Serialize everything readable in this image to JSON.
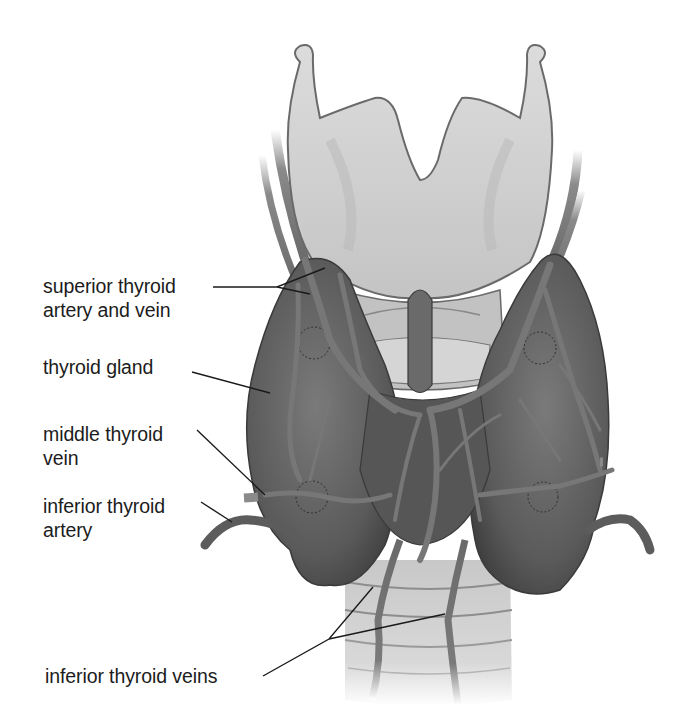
{
  "diagram": {
    "colors": {
      "background": "#ffffff",
      "text": "#1c1c1c",
      "leader_line": "#1a1a1a",
      "cartilage": "#cfcfcf",
      "gland": "#5e5e5e",
      "vessel": "#6f6f6f"
    },
    "labels": [
      {
        "id": "superior-thyroid-artery-and-vein",
        "lines": [
          "superior thyroid",
          "artery and vein"
        ]
      },
      {
        "id": "thyroid-gland",
        "lines": [
          "thyroid gland"
        ]
      },
      {
        "id": "middle-thyroid-vein",
        "lines": [
          "middle thyroid",
          "vein"
        ]
      },
      {
        "id": "inferior-thyroid-artery",
        "lines": [
          "inferior thyroid",
          "artery"
        ]
      },
      {
        "id": "inferior-thyroid-veins",
        "lines": [
          "inferior thyroid veins"
        ]
      }
    ]
  }
}
